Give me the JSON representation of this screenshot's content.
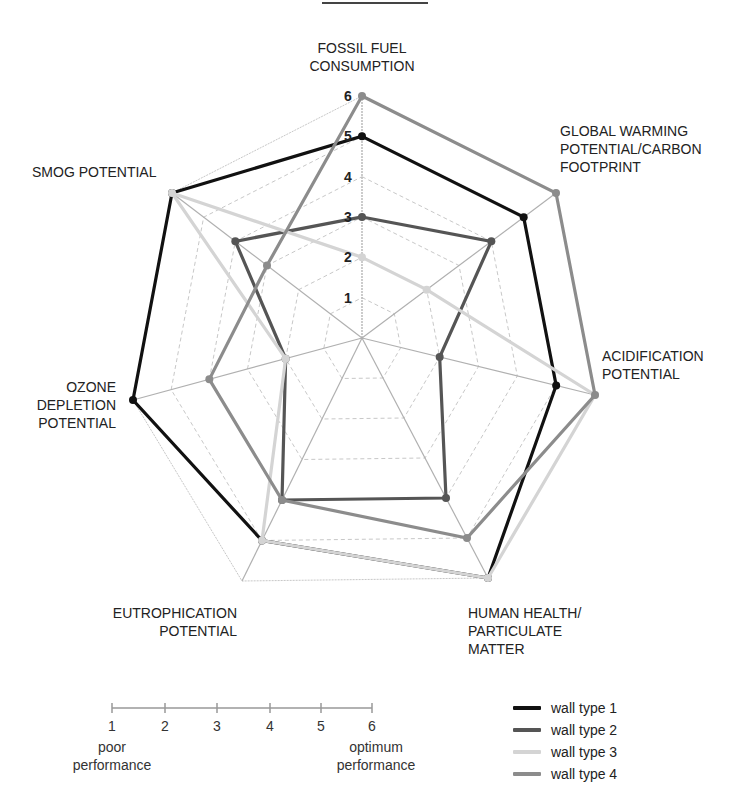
{
  "chart_data": {
    "type": "radar",
    "title": "",
    "axes": [
      {
        "key": "fossil",
        "label_lines": [
          "FOSSIL FUEL",
          "CONSUMPTION"
        ]
      },
      {
        "key": "gwp",
        "label_lines": [
          "GLOBAL WARMING",
          "POTENTIAL/CARBON",
          "FOOTPRINT"
        ]
      },
      {
        "key": "acid",
        "label_lines": [
          "ACIDIFICATION",
          "POTENTIAL"
        ]
      },
      {
        "key": "health",
        "label_lines": [
          "HUMAN HEALTH/",
          "PARTICULATE",
          "MATTER"
        ]
      },
      {
        "key": "eutro",
        "label_lines": [
          "EUTROPHICATION",
          "POTENTIAL"
        ]
      },
      {
        "key": "ozone",
        "label_lines": [
          "OZONE",
          "DEPLETION",
          "POTENTIAL"
        ]
      },
      {
        "key": "smog",
        "label_lines": [
          "SMOG POTENTIAL"
        ]
      }
    ],
    "categories": [
      "Fossil Fuel Consumption",
      "Global Warming Potential/Carbon Footprint",
      "Acidification Potential",
      "Human Health/Particulate Matter",
      "Eutrophication Potential",
      "Ozone Depletion Potential",
      "Smog Potential"
    ],
    "range": [
      0,
      6
    ],
    "ticks": [
      "1",
      "2",
      "3",
      "4",
      "5",
      "6"
    ],
    "series": [
      {
        "name": "wall type 1",
        "color": "#111111",
        "width": 3.2,
        "values": [
          5,
          5,
          5,
          6,
          5,
          6,
          6
        ]
      },
      {
        "name": "wall type 2",
        "color": "#555555",
        "width": 3.2,
        "values": [
          3,
          4,
          2,
          4,
          4,
          2,
          4
        ]
      },
      {
        "name": "wall type 3",
        "color": "#d4d4d4",
        "width": 3.2,
        "values": [
          2,
          2,
          6,
          6,
          5,
          2,
          6
        ]
      },
      {
        "name": "wall type 4",
        "color": "#8c8c8c",
        "width": 3.2,
        "values": [
          6,
          6,
          6,
          5,
          4,
          4,
          3
        ]
      }
    ],
    "legend_position": "bottom-right",
    "grid": true
  },
  "labels": {
    "fossil": [
      "FOSSIL FUEL",
      "CONSUMPTION"
    ],
    "gwp": [
      "GLOBAL WARMING",
      "POTENTIAL/CARBON",
      "FOOTPRINT"
    ],
    "acid": [
      "ACIDIFICATION",
      "POTENTIAL"
    ],
    "health": [
      "HUMAN HEALTH/",
      "PARTICULATE",
      "MATTER"
    ],
    "eutro": [
      "EUTROPHICATION",
      "POTENTIAL"
    ],
    "ozone": [
      "OZONE",
      "DEPLETION",
      "POTENTIAL"
    ],
    "smog": [
      "SMOG POTENTIAL"
    ]
  },
  "scale": {
    "numbers": [
      "1",
      "2",
      "3",
      "4",
      "5",
      "6"
    ],
    "low_text": [
      "poor",
      "performance"
    ],
    "high_text": [
      "optimum",
      "performance"
    ]
  },
  "legend": [
    {
      "label": "wall type 1",
      "color": "#111111"
    },
    {
      "label": "wall type 2",
      "color": "#555555"
    },
    {
      "label": "wall type 3",
      "color": "#d4d4d4"
    },
    {
      "label": "wall type 4",
      "color": "#8c8c8c"
    }
  ]
}
